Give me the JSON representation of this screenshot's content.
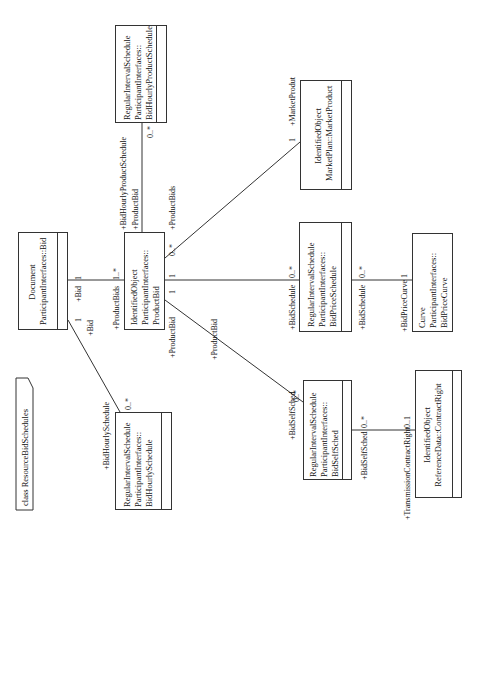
{
  "frame": {
    "label": "class ResourceBidSchedules"
  },
  "classes": {
    "bid_hourly_product_schedule": {
      "lines": [
        "RegularIntervalSchedule",
        "ParticipantInterfaces::",
        "BidHourlyProductSchedule"
      ]
    },
    "market_product": {
      "lines": [
        "IdentifiedObject",
        "MarketPlan::MarketProduct"
      ]
    },
    "document_bid": {
      "lines": [
        "Document",
        "ParticipantInterfaces::Bid"
      ]
    },
    "product_bid": {
      "lines": [
        "IdentifiedObject",
        "ParticipantInterfaces::",
        "ProductBid"
      ]
    },
    "bid_price_schedule": {
      "lines": [
        "RegularIntervalSchedule",
        "ParticipantInterfaces::",
        "BidPriceSchedule"
      ]
    },
    "curve": {
      "lines": [
        "Curve",
        "ParticipantInterfaces::",
        "BidPriceCurve"
      ]
    },
    "bid_self_sched": {
      "lines": [
        "RegularIntervalSchedule",
        "ParticipantInterfaces::",
        "BidSelfSched"
      ]
    },
    "contract_right": {
      "lines": [
        "IdentifiedObject",
        "ReferenceData::ContractRight"
      ]
    },
    "bid_hourly_schedule": {
      "lines": [
        "RegularIntervalSchedule",
        "ParticipantInterfaces::",
        "BidHourlySchedule"
      ]
    }
  },
  "associations": {
    "bid_productbid": {
      "role_a": "+Bid",
      "mult_a": "1",
      "role_b": "+ProductBids",
      "mult_b": "1..*"
    },
    "productbid_hourlyproduct": {
      "role_a": "+ProductBid",
      "role_b": "+BidHourlyProductSchedule",
      "mult_b": "0..*"
    },
    "productbid_marketproduct": {
      "role_a": "+ProductBids",
      "mult_a": "0..*",
      "role_b": "+MarketProdut",
      "mult_b": "1"
    },
    "productbid_pricesched": {
      "mult_a": "1",
      "role_b": "+BidSchedule",
      "mult_b": "0..*"
    },
    "pricesched_curve": {
      "role_a": "+BidSchedule",
      "mult_a": "0..*",
      "role_b": "+BidPriceCurve",
      "mult_b": "1"
    },
    "productbid_selfsched": {
      "role_a": "+ProductBid",
      "mult_a": "1",
      "role_b": "+BidSelfSched",
      "mult_b": "0..*"
    },
    "selfsched_contract": {
      "role_a": "+BidSelfSched",
      "mult_a": "0..*",
      "role_b": "+TransmissionContractRight",
      "mult_b": "0..1"
    },
    "bid_hourlysched": {
      "role_a": "+Bid",
      "mult_a": "1",
      "role_b": "+BidHourlySchedule",
      "mult_b": "0..*"
    },
    "productbid_bottom": {
      "role": "+ProductBid"
    }
  },
  "colors": {
    "line": "#333333",
    "background": "#ffffff",
    "text": "#111111"
  }
}
